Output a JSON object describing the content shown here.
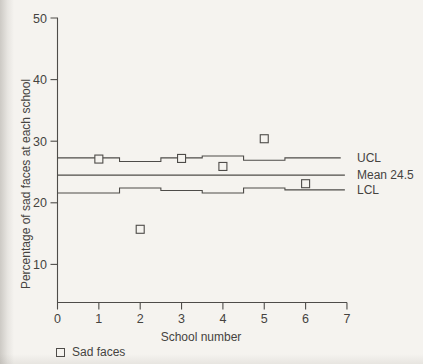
{
  "page": {
    "background": "#f5f3ef",
    "ink_color": "#4e4c49",
    "text_color": "#45433f"
  },
  "chart_data": {
    "type": "scatter",
    "title": "",
    "xlabel": "School number",
    "ylabel": "Percentage of sad faces at each school",
    "grid": false,
    "legend_position": "bottom-left",
    "x_axis": {
      "range": [
        0,
        7
      ],
      "ticks": [
        0,
        1,
        2,
        3,
        4,
        5,
        6,
        7
      ]
    },
    "y_axis": {
      "range": [
        3.8,
        50
      ],
      "ticks": [
        10,
        20,
        30,
        40,
        50
      ]
    },
    "points": {
      "name": "Sad faces",
      "marker": "open-square",
      "x": [
        1,
        2,
        3,
        4,
        5,
        6
      ],
      "y": [
        27.1,
        15.7,
        27.2,
        25.9,
        30.4,
        23.1
      ]
    },
    "mean": {
      "label": "Mean 24.5",
      "value": 24.5,
      "x_start": 0,
      "x_end": 6.95
    },
    "ucl": {
      "label": "UCL",
      "segments": [
        {
          "x_start": 0,
          "x_end": 1.5,
          "value": 27.3
        },
        {
          "x_start": 1.5,
          "x_end": 2.5,
          "value": 26.7
        },
        {
          "x_start": 2.5,
          "x_end": 3.5,
          "value": 27.3
        },
        {
          "x_start": 3.5,
          "x_end": 4.5,
          "value": 27.6
        },
        {
          "x_start": 4.5,
          "x_end": 5.5,
          "value": 26.9
        },
        {
          "x_start": 5.5,
          "x_end": 6.85,
          "value": 27.3
        }
      ]
    },
    "lcl": {
      "label": "LCL",
      "segments": [
        {
          "x_start": 0,
          "x_end": 1.5,
          "value": 21.6
        },
        {
          "x_start": 1.5,
          "x_end": 2.5,
          "value": 22.4
        },
        {
          "x_start": 2.5,
          "x_end": 3.5,
          "value": 22.0
        },
        {
          "x_start": 3.5,
          "x_end": 4.5,
          "value": 21.6
        },
        {
          "x_start": 4.5,
          "x_end": 5.5,
          "value": 22.4
        },
        {
          "x_start": 5.5,
          "x_end": 6.95,
          "value": 22.1
        }
      ]
    },
    "legend": {
      "items": [
        {
          "marker": "open-square",
          "label": "Sad faces"
        }
      ]
    }
  }
}
